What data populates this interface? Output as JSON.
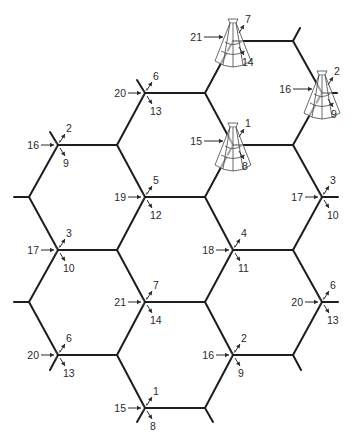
{
  "diagram": {
    "title": "Hexagonal cell layout with 21-channel-set sectorized cell sites",
    "colors": {
      "line": "#1e1e1e",
      "text": "#2a2a2a",
      "background": "#ffffff"
    },
    "edges": [
      [
        [
          233,
          41
        ],
        [
          293,
          41
        ]
      ],
      [
        [
          293,
          41
        ],
        [
          300,
          28
        ]
      ],
      [
        [
          293,
          41
        ],
        [
          322,
          93
        ]
      ],
      [
        [
          322,
          93
        ],
        [
          337,
          93
        ]
      ],
      [
        [
          233,
          41
        ],
        [
          205,
          93
        ]
      ],
      [
        [
          205,
          93
        ],
        [
          145,
          93
        ]
      ],
      [
        [
          145,
          93
        ],
        [
          137,
          80
        ]
      ],
      [
        [
          145,
          93
        ],
        [
          117,
          145
        ]
      ],
      [
        [
          205,
          93
        ],
        [
          233,
          145
        ]
      ],
      [
        [
          322,
          93
        ],
        [
          293,
          145
        ]
      ],
      [
        [
          233,
          145
        ],
        [
          293,
          145
        ]
      ],
      [
        [
          58,
          145
        ],
        [
          117,
          145
        ]
      ],
      [
        [
          58,
          145
        ],
        [
          50,
          132
        ]
      ],
      [
        [
          58,
          145
        ],
        [
          29,
          197
        ]
      ],
      [
        [
          29,
          197
        ],
        [
          14,
          197
        ]
      ],
      [
        [
          117,
          145
        ],
        [
          145,
          197
        ]
      ],
      [
        [
          145,
          197
        ],
        [
          205,
          197
        ]
      ],
      [
        [
          205,
          197
        ],
        [
          233,
          145
        ]
      ],
      [
        [
          293,
          145
        ],
        [
          322,
          197
        ]
      ],
      [
        [
          322,
          197
        ],
        [
          338,
          197
        ]
      ],
      [
        [
          29,
          197
        ],
        [
          58,
          250
        ]
      ],
      [
        [
          58,
          250
        ],
        [
          117,
          250
        ]
      ],
      [
        [
          117,
          250
        ],
        [
          145,
          197
        ]
      ],
      [
        [
          205,
          197
        ],
        [
          233,
          250
        ]
      ],
      [
        [
          233,
          250
        ],
        [
          293,
          250
        ]
      ],
      [
        [
          293,
          250
        ],
        [
          322,
          197
        ]
      ],
      [
        [
          117,
          250
        ],
        [
          145,
          302
        ]
      ],
      [
        [
          145,
          302
        ],
        [
          205,
          302
        ]
      ],
      [
        [
          205,
          302
        ],
        [
          233,
          250
        ]
      ],
      [
        [
          58,
          250
        ],
        [
          29,
          302
        ]
      ],
      [
        [
          29,
          302
        ],
        [
          14,
          302
        ]
      ],
      [
        [
          293,
          250
        ],
        [
          322,
          302
        ]
      ],
      [
        [
          322,
          302
        ],
        [
          338,
          302
        ]
      ],
      [
        [
          29,
          302
        ],
        [
          58,
          355
        ]
      ],
      [
        [
          58,
          355
        ],
        [
          117,
          355
        ]
      ],
      [
        [
          117,
          355
        ],
        [
          145,
          302
        ]
      ],
      [
        [
          58,
          355
        ],
        [
          50,
          370
        ]
      ],
      [
        [
          205,
          302
        ],
        [
          233,
          355
        ]
      ],
      [
        [
          233,
          355
        ],
        [
          293,
          355
        ]
      ],
      [
        [
          293,
          355
        ],
        [
          322,
          302
        ]
      ],
      [
        [
          293,
          355
        ],
        [
          301,
          370
        ]
      ],
      [
        [
          117,
          355
        ],
        [
          145,
          408
        ]
      ],
      [
        [
          145,
          408
        ],
        [
          205,
          408
        ]
      ],
      [
        [
          205,
          408
        ],
        [
          233,
          355
        ]
      ],
      [
        [
          145,
          408
        ],
        [
          137,
          422
        ]
      ],
      [
        [
          205,
          408
        ],
        [
          213,
          422
        ]
      ]
    ],
    "sites": [
      {
        "x": 233,
        "y": 41,
        "left": "21",
        "up": "7",
        "down": "14",
        "tower": true
      },
      {
        "x": 322,
        "y": 93,
        "left": "16",
        "up": "2",
        "down": "9",
        "tower": true
      },
      {
        "x": 145,
        "y": 93,
        "left": "20",
        "up": "6",
        "down": "13",
        "tower": false
      },
      {
        "x": 58,
        "y": 145,
        "left": "16",
        "up": "2",
        "down": "9",
        "tower": false
      },
      {
        "x": 233,
        "y": 145,
        "left": "15",
        "up": "1",
        "down": "8",
        "tower": true
      },
      {
        "x": 145,
        "y": 197,
        "left": "19",
        "up": "5",
        "down": "12",
        "tower": false
      },
      {
        "x": 322,
        "y": 197,
        "left": "17",
        "up": "3",
        "down": "10",
        "tower": false
      },
      {
        "x": 58,
        "y": 250,
        "left": "17",
        "up": "3",
        "down": "10",
        "tower": false
      },
      {
        "x": 233,
        "y": 250,
        "left": "18",
        "up": "4",
        "down": "11",
        "tower": false
      },
      {
        "x": 145,
        "y": 302,
        "left": "21",
        "up": "7",
        "down": "14",
        "tower": false
      },
      {
        "x": 322,
        "y": 302,
        "left": "20",
        "up": "6",
        "down": "13",
        "tower": false
      },
      {
        "x": 58,
        "y": 355,
        "left": "20",
        "up": "6",
        "down": "13",
        "tower": false
      },
      {
        "x": 233,
        "y": 355,
        "left": "16",
        "up": "2",
        "down": "9",
        "tower": false
      },
      {
        "x": 145,
        "y": 408,
        "left": "15",
        "up": "1",
        "down": "8",
        "tower": false
      }
    ]
  }
}
